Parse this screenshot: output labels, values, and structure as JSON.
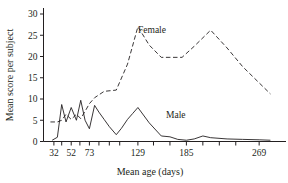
{
  "chart_data": {
    "type": "line",
    "title": "",
    "subtitle": "",
    "xlabel": "Mean age (days)",
    "ylabel": "Mean score per subject",
    "xlim": [
      20,
      300
    ],
    "ylim": [
      0,
      31
    ],
    "grid": false,
    "legend_position": "inline-annotations",
    "x_tick_labels": [
      "32",
      "52",
      "73",
      "129",
      "185",
      "269"
    ],
    "x_tick_values": [
      32,
      52,
      73,
      129,
      185,
      269
    ],
    "x_minor_tick_values": [
      41,
      62,
      84,
      96,
      108,
      147,
      166,
      204,
      223,
      242
    ],
    "y_tick_labels": [
      "0",
      "5",
      "10",
      "15",
      "20",
      "25",
      "30"
    ],
    "y_tick_values": [
      0,
      5,
      10,
      15,
      20,
      25,
      30
    ],
    "series": [
      {
        "name": "Female",
        "style": "dashed",
        "color": "#231f20",
        "annotation": "Female",
        "x": [
          28,
          36,
          41,
          46,
          52,
          58,
          63,
          68,
          73,
          79,
          90,
          104,
          117,
          129,
          142,
          156,
          166,
          180,
          194,
          213,
          232,
          250,
          269,
          282
        ],
        "y": [
          4.6,
          4.6,
          5.0,
          6.4,
          5.2,
          6.4,
          5.4,
          7.1,
          8.9,
          10.3,
          11.8,
          12.1,
          18.2,
          27.0,
          22.7,
          19.8,
          19.8,
          19.8,
          22.4,
          26.2,
          22.0,
          17.6,
          13.8,
          11.2
        ]
      },
      {
        "name": "Male",
        "style": "solid",
        "color": "#231f20",
        "annotation": "Male",
        "x": [
          30,
          36,
          41,
          46,
          52,
          58,
          63,
          68,
          73,
          79,
          84,
          90,
          96,
          104,
          110,
          117,
          123,
          129,
          142,
          156,
          166,
          175,
          185,
          194,
          204,
          213,
          232,
          250,
          269,
          282
        ],
        "y": [
          0.3,
          1.0,
          8.7,
          4.6,
          8.0,
          5.0,
          9.7,
          5.0,
          3.0,
          8.5,
          6.9,
          5.2,
          3.5,
          1.6,
          3.1,
          5.2,
          6.6,
          8.0,
          4.4,
          1.3,
          1.1,
          0.5,
          0.3,
          0.6,
          1.3,
          0.9,
          0.6,
          0.5,
          0.4,
          0.3
        ]
      }
    ]
  },
  "annotations": {
    "female_label": "Female",
    "male_label": "Male"
  }
}
